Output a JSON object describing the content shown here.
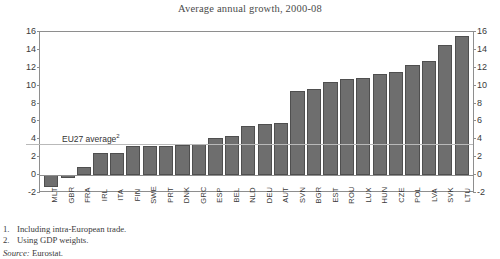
{
  "chart_data": {
    "type": "bar",
    "title": "Average annual growth, 2000-08",
    "xlabel": "",
    "ylabel": "",
    "ylim": [
      -2,
      16
    ],
    "yticks": [
      16,
      14,
      12,
      10,
      8,
      6,
      4,
      2,
      0,
      -2
    ],
    "grid": false,
    "legend": null,
    "bar_color": "#6e6e6e",
    "categories": [
      "MLT",
      "GBR",
      "FRA",
      "IRL",
      "ITA",
      "FIN",
      "SWE",
      "PRT",
      "DNK",
      "GRC",
      "ESP",
      "BEL",
      "NLD",
      "DEU",
      "AUT",
      "SVN",
      "BGR",
      "EST",
      "ROU",
      "LUX",
      "HUN",
      "CZE",
      "POL",
      "LVA",
      "SVK",
      "LTU"
    ],
    "values": [
      -1.3,
      -0.3,
      0.9,
      2.5,
      2.5,
      3.3,
      3.3,
      3.3,
      3.4,
      3.5,
      4.1,
      4.4,
      5.5,
      5.7,
      5.8,
      9.4,
      9.6,
      10.4,
      10.7,
      10.9,
      11.3,
      11.5,
      12.3,
      12.8,
      14.5,
      15.6
    ],
    "annotations": [
      {
        "text": "EU27 average",
        "superscript": "2",
        "value": 3.5
      }
    ]
  },
  "axis": {
    "left_ticks": [
      "16",
      "14",
      "12",
      "10",
      "8",
      "6",
      "4",
      "2",
      "0",
      "-2"
    ],
    "right_ticks": [
      "16",
      "14",
      "12",
      "10",
      "8",
      "6",
      "4",
      "2",
      "0",
      "-2"
    ]
  },
  "notes": [
    {
      "num": "1.",
      "text": "Including intra-European trade."
    },
    {
      "num": "2.",
      "text": "Using GDP weights."
    }
  ],
  "source": {
    "label": "Source:",
    "value": "Eurostat."
  }
}
